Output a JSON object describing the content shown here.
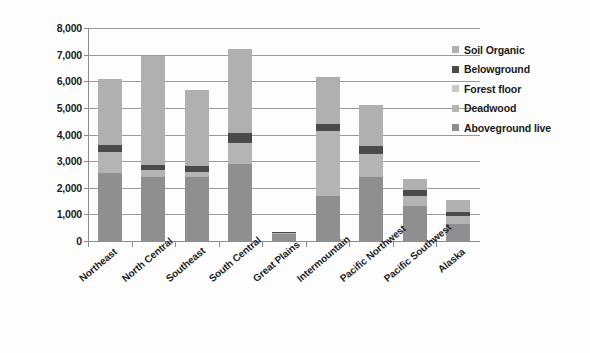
{
  "chart_data": {
    "type": "bar",
    "subtype": "stacked-vertical",
    "title": "",
    "xlabel": "",
    "ylabel": "Million metric tonnes",
    "ylim": [
      0,
      8000
    ],
    "ytick_step": 1000,
    "ytick_labels": [
      "8,000",
      "7,000",
      "6,000",
      "5,000",
      "4,000",
      "3,000",
      "2,000",
      "1,000",
      "0"
    ],
    "grid": true,
    "legend_position": "right",
    "categories": [
      "Northeast",
      "North Central",
      "Southeast",
      "South Central",
      "Great Plains",
      "Intermountain",
      "Pacific Northwest",
      "Pacific Southwest",
      "Alaska"
    ],
    "series": [
      {
        "name": "Aboveground live",
        "color": "#8f8f8f",
        "values": [
          2550,
          2400,
          2400,
          2900,
          250,
          1700,
          2400,
          1300,
          650
        ]
      },
      {
        "name": "Deadwood",
        "color": "#b4b4b4",
        "values": [
          800,
          250,
          200,
          800,
          50,
          2450,
          850,
          400,
          300
        ]
      },
      {
        "name": "Forest floor",
        "color": "#c9c9c9",
        "values": [
          0,
          0,
          0,
          0,
          0,
          0,
          0,
          0,
          0
        ]
      },
      {
        "name": "Belowground",
        "color": "#4a4a4a",
        "values": [
          250,
          200,
          200,
          350,
          50,
          250,
          300,
          200,
          150
        ]
      },
      {
        "name": "Soil Organic",
        "color": "#b0b0b0",
        "values": [
          2480,
          4100,
          2880,
          3150,
          0,
          1750,
          1550,
          430,
          450
        ]
      }
    ],
    "totals": [
      6080,
      6950,
      5680,
      7200,
      350,
      6150,
      5100,
      2330,
      1550
    ]
  },
  "legend": {
    "items": [
      {
        "label": "Soil Organic",
        "color": "#b0b0b0"
      },
      {
        "label": "Belowground",
        "color": "#4a4a4a"
      },
      {
        "label": "Forest floor",
        "color": "#c9c9c9"
      },
      {
        "label": "Deadwood",
        "color": "#b4b4b4"
      },
      {
        "label": "Aboveground live",
        "color": "#8f8f8f"
      }
    ]
  },
  "axes": {
    "y_title": "Million metric tonnes"
  },
  "colors": {
    "gridline": "#9a9a9a",
    "axis": "#8d8d8d",
    "text": "#1c1c1c",
    "background": "#fdfdfd"
  }
}
